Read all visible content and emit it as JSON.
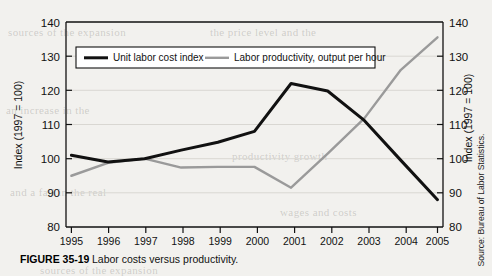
{
  "figure": {
    "caption_label": "FIGURE 35-19",
    "caption_text": "Labor costs versus productivity.",
    "source_note": "Source: Bureau of Labor Statistics."
  },
  "axes": {
    "left_title": "Index (1997 = 100)",
    "right_title": "Index (1997 = 100)"
  },
  "colors": {
    "series_unit_labor_cost": "#111111",
    "series_labor_productivity": "#9a9a9a",
    "axis": "#111111",
    "gridline": "#d9d7d2",
    "page_background": "#f2f1ee"
  },
  "chart_data": {
    "type": "line",
    "title": "Labor costs versus productivity.",
    "xlabel": "",
    "ylabel": "Index (1997 = 100)",
    "y2label": "Index (1997 = 100)",
    "ylim": [
      80,
      140
    ],
    "y2lim": [
      80,
      140
    ],
    "yticks": [
      80,
      90,
      100,
      110,
      120,
      130,
      140
    ],
    "y2ticks": [
      80,
      90,
      100,
      110,
      120,
      130,
      140
    ],
    "grid": true,
    "legend_position": "top-inside",
    "categories": [
      "1995",
      "1996",
      "1997",
      "1998",
      "1999",
      "2000",
      "2001",
      "2002",
      "2003",
      "2004",
      "2005"
    ],
    "x": [
      1995,
      1996,
      1997,
      1998,
      1999,
      2000,
      2001,
      2002,
      2003,
      2004,
      2005
    ],
    "series": [
      {
        "name": "Unit labor cost index",
        "color": "#111111",
        "values": [
          101.0,
          99.0,
          100.0,
          102.5,
          104.8,
          108.0,
          122.0,
          119.8,
          111.2,
          99.5,
          88.0
        ]
      },
      {
        "name": "Labor productivity, output per hour",
        "color": "#9a9a9a",
        "values": [
          95.0,
          98.8,
          100.0,
          97.4,
          97.6,
          97.6,
          91.5,
          101.5,
          111.8,
          126.0,
          135.5
        ]
      }
    ]
  },
  "ghost_text": {
    "lines": [
      "sources of the expansion",
      "the price level and the",
      "an increase in the",
      "productivity growth",
      "and a fall in the real",
      "wages and costs"
    ]
  }
}
